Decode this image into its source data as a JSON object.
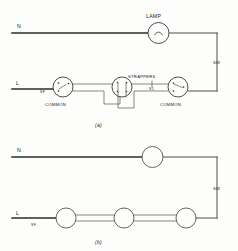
{
  "figure": {
    "title_visible": false,
    "background_color": "#fdfdfb",
    "ink_color": "#3a3a3a"
  },
  "diagram_a": {
    "caption": "(a)",
    "labels": {
      "neutral": "N",
      "live": "L",
      "lamp": "LAMP",
      "strappers": "STRAPPERS",
      "switch_wire": "SW",
      "common_left": "COMMON",
      "common_right": "COMMON",
      "feed_left": "SF",
      "strapper_mark": "S1"
    }
  },
  "diagram_b": {
    "caption": "(b)",
    "labels": {
      "neutral": "N",
      "live": "L",
      "switch_wire": "SW",
      "feed_left": "SF"
    }
  }
}
